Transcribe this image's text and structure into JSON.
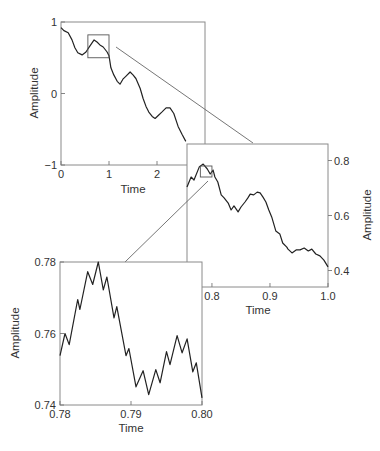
{
  "chart_data": [
    {
      "id": "full",
      "type": "line",
      "title": "",
      "xlabel": "Time",
      "ylabel": "Amplitude",
      "xlim": [
        0,
        3
      ],
      "ylim": [
        -1,
        1
      ],
      "xticks": [
        0,
        1,
        2
      ],
      "xtick_labels": [
        "0",
        "1",
        "2"
      ],
      "yticks": [
        -1,
        0,
        1
      ],
      "ytick_labels": [
        "−1",
        "0",
        "1"
      ],
      "ylabel_side": "left",
      "grid": false,
      "zoom_box": {
        "x": [
          0.56,
          1.0
        ],
        "y": [
          0.5,
          0.82
        ]
      },
      "x": [
        0.0,
        0.06,
        0.15,
        0.23,
        0.29,
        0.35,
        0.44,
        0.52,
        0.58,
        0.65,
        0.69,
        0.75,
        0.81,
        0.88,
        0.96,
        1.0,
        1.04,
        1.1,
        1.17,
        1.23,
        1.29,
        1.35,
        1.44,
        1.5,
        1.56,
        1.65,
        1.71,
        1.77,
        1.83,
        1.9,
        1.96,
        2.02,
        2.1,
        2.19,
        2.27,
        2.35,
        2.44,
        2.52,
        2.6
      ],
      "y": [
        0.92,
        0.88,
        0.85,
        0.75,
        0.64,
        0.57,
        0.54,
        0.58,
        0.64,
        0.71,
        0.75,
        0.72,
        0.68,
        0.65,
        0.58,
        0.53,
        0.36,
        0.26,
        0.17,
        0.13,
        0.2,
        0.24,
        0.3,
        0.26,
        0.21,
        0.07,
        -0.07,
        -0.18,
        -0.26,
        -0.32,
        -0.35,
        -0.31,
        -0.26,
        -0.2,
        -0.2,
        -0.28,
        -0.46,
        -0.57,
        -0.67
      ]
    },
    {
      "id": "zoom1",
      "type": "line",
      "title": "",
      "xlabel": "Time",
      "ylabel": "Amplitude",
      "xlim": [
        0.757,
        1.0
      ],
      "ylim": [
        0.34,
        0.86
      ],
      "xticks": [
        0.8,
        0.9,
        1.0
      ],
      "xtick_labels": [
        "0.8",
        "0.9",
        "1.0"
      ],
      "yticks": [
        0.4,
        0.6,
        0.8
      ],
      "ytick_labels": [
        "0.4",
        "0.6",
        "0.8"
      ],
      "ylabel_side": "right",
      "grid": false,
      "zoom_box": {
        "x": [
          0.78,
          0.8
        ],
        "y": [
          0.74,
          0.78
        ]
      },
      "x": [
        0.757,
        0.764,
        0.769,
        0.778,
        0.785,
        0.792,
        0.797,
        0.802,
        0.805,
        0.81,
        0.816,
        0.821,
        0.828,
        0.833,
        0.838,
        0.845,
        0.85,
        0.857,
        0.862,
        0.866,
        0.872,
        0.878,
        0.883,
        0.888,
        0.893,
        0.898,
        0.903,
        0.91,
        0.917,
        0.922,
        0.929,
        0.931,
        0.938,
        0.945,
        0.952,
        0.959,
        0.966,
        0.972,
        0.979,
        0.986,
        0.993,
        1.0
      ],
      "y": [
        0.704,
        0.74,
        0.729,
        0.776,
        0.787,
        0.769,
        0.751,
        0.765,
        0.74,
        0.722,
        0.675,
        0.664,
        0.645,
        0.62,
        0.635,
        0.613,
        0.631,
        0.649,
        0.664,
        0.678,
        0.675,
        0.685,
        0.682,
        0.667,
        0.649,
        0.62,
        0.595,
        0.544,
        0.533,
        0.5,
        0.485,
        0.478,
        0.464,
        0.475,
        0.475,
        0.482,
        0.471,
        0.478,
        0.46,
        0.453,
        0.438,
        0.413
      ]
    },
    {
      "id": "zoom2",
      "type": "line",
      "title": "",
      "xlabel": "Time",
      "ylabel": "Amplitude",
      "xlim": [
        0.78,
        0.8
      ],
      "ylim": [
        0.74,
        0.78
      ],
      "xticks": [
        0.78,
        0.79,
        0.8
      ],
      "xtick_labels": [
        "0.78",
        "0.79",
        "0.80"
      ],
      "yticks": [
        0.74,
        0.76,
        0.78
      ],
      "ytick_labels": [
        "0.74",
        "0.76",
        "0.78"
      ],
      "ylabel_side": "left",
      "grid": false,
      "x": [
        0.78,
        0.7807,
        0.7813,
        0.7825,
        0.7828,
        0.7839,
        0.7846,
        0.7854,
        0.7861,
        0.7866,
        0.7876,
        0.788,
        0.7893,
        0.7897,
        0.7907,
        0.7917,
        0.7925,
        0.7935,
        0.7941,
        0.795,
        0.7955,
        0.7965,
        0.7972,
        0.7979,
        0.7987,
        0.7992,
        0.8
      ],
      "y": [
        0.7538,
        0.76,
        0.7569,
        0.7695,
        0.7667,
        0.7773,
        0.7737,
        0.78,
        0.7722,
        0.7758,
        0.7644,
        0.7675,
        0.7538,
        0.7558,
        0.7451,
        0.7496,
        0.7429,
        0.7499,
        0.7462,
        0.7549,
        0.7513,
        0.7594,
        0.7546,
        0.7585,
        0.7493,
        0.7518,
        0.742
      ]
    }
  ],
  "connectors": [
    {
      "from": "full.zoom_box",
      "to": "zoom1"
    },
    {
      "from": "zoom1.zoom_box",
      "to": "zoom2"
    }
  ],
  "caption": ""
}
